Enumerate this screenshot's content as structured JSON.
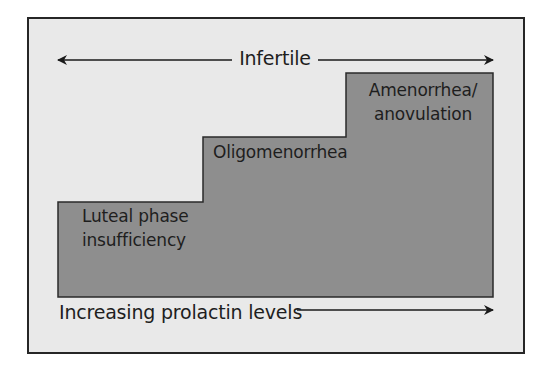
{
  "diagram": {
    "top_arrow": {
      "label": "Infertile",
      "direction": "bidirectional"
    },
    "steps": [
      {
        "id": "step1",
        "lines": [
          "Luteal phase",
          "insufficiency"
        ],
        "level": 1
      },
      {
        "id": "step2",
        "lines": [
          "Oligomenorrhea"
        ],
        "level": 2
      },
      {
        "id": "step3",
        "lines": [
          "Amenorrhea/",
          "anovulation"
        ],
        "level": 3
      }
    ],
    "bottom_arrow": {
      "label": "Increasing prolactin levels",
      "direction": "right"
    }
  },
  "colors": {
    "frame_background": "#e9e9e9",
    "frame_border": "#262626",
    "step_fill": "#8e8e8e",
    "step_stroke": "#2a2a2a",
    "text": "#1e1e1e",
    "arrow": "#1a1a1a"
  }
}
